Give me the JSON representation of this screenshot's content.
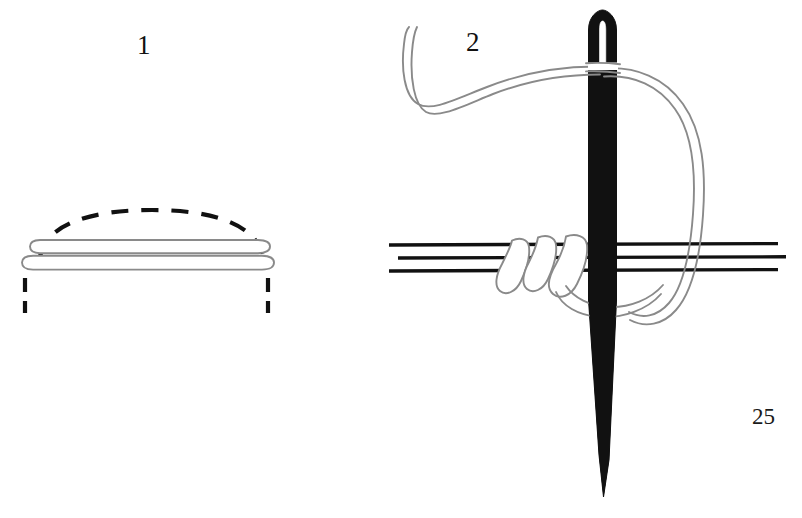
{
  "page": {
    "number": "25",
    "background_color": "#ffffff",
    "width": 802,
    "height": 518
  },
  "figures": [
    {
      "label": "1",
      "name": "stitch-step-1-diagram",
      "description": "Side view of two stacked thread loops with a dashed arc above and two dashed vertical guide marks below",
      "thread_color": "#8a8a8a",
      "dash_color": "#111111"
    },
    {
      "label": "2",
      "name": "stitch-step-2-diagram",
      "description": "Threaded needle passing vertically through three horizontal fabric guide lines with thread coiled around them and a large loop to the right",
      "needle_color": "#111111",
      "thread_color": "#8a8a8a",
      "fabric_line_color": "#111111"
    }
  ],
  "elements": {
    "dashed_arc": "dashed-arc",
    "thread_loop_upper": "thread-loop-upper",
    "thread_loop_lower": "thread-loop-lower",
    "dash_guide_left": "dashed-guide-left",
    "dash_guide_right": "dashed-guide-right",
    "needle": "sewing-needle",
    "needle_eye": "needle-eye",
    "thread_tail": "thread-tail",
    "thread_loop_right": "thread-loop-right",
    "thread_coils": "thread-coils",
    "fabric_lines": "fabric-guide-lines"
  }
}
